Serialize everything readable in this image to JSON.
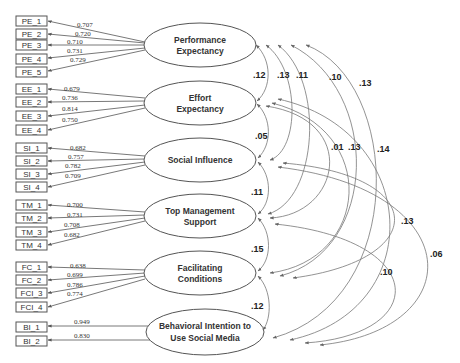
{
  "diagram": {
    "type": "structural-equation-model",
    "constructs": [
      {
        "id": "PE",
        "label_lines": [
          "Performance",
          "Expectancy"
        ],
        "indicators": [
          {
            "name": "PE_1",
            "loading": "0.707"
          },
          {
            "name": "PE_2",
            "loading": "0.720"
          },
          {
            "name": "PE_3",
            "loading": "0.710"
          },
          {
            "name": "PE_4",
            "loading": "0.731"
          },
          {
            "name": "PE_5",
            "loading": "0.729"
          }
        ]
      },
      {
        "id": "EE",
        "label_lines": [
          "Effort",
          "Expectancy"
        ],
        "indicators": [
          {
            "name": "EE_1",
            "loading": "0.679"
          },
          {
            "name": "EE_2",
            "loading": "0.736"
          },
          {
            "name": "EE_3",
            "loading": "0.814"
          },
          {
            "name": "EE_4",
            "loading": "0.750"
          }
        ]
      },
      {
        "id": "SI",
        "label_lines": [
          "Social Influence"
        ],
        "indicators": [
          {
            "name": "SI_1",
            "loading": "0.682"
          },
          {
            "name": "SI_2",
            "loading": "0.757"
          },
          {
            "name": "SI_3",
            "loading": "0.782"
          },
          {
            "name": "SI_4",
            "loading": "0.709"
          }
        ]
      },
      {
        "id": "TM",
        "label_lines": [
          "Top Management",
          "Support"
        ],
        "indicators": [
          {
            "name": "TM_1",
            "loading": "0.700"
          },
          {
            "name": "TM_2",
            "loading": "0.731"
          },
          {
            "name": "TM_3",
            "loading": "0.708"
          },
          {
            "name": "TM_4",
            "loading": "0.682"
          }
        ]
      },
      {
        "id": "FC",
        "label_lines": [
          "Facilitating",
          "Conditions"
        ],
        "indicators": [
          {
            "name": "FC_1",
            "loading": "0.638"
          },
          {
            "name": "FC_2",
            "loading": "0.699"
          },
          {
            "name": "FCI_3",
            "loading": "0.786"
          },
          {
            "name": "FCI_4",
            "loading": "0.774"
          }
        ]
      },
      {
        "id": "BI",
        "label_lines": [
          "Behavioral Intention to",
          "Use Social Media"
        ],
        "indicators": [
          {
            "name": "BI_1",
            "loading": "0.949"
          },
          {
            "name": "BI_2",
            "loading": "0.830"
          }
        ]
      }
    ],
    "covariances": [
      {
        "from": "PE",
        "to": "EE",
        "value": ".12"
      },
      {
        "from": "PE",
        "to": "SI",
        "value": ".13"
      },
      {
        "from": "PE",
        "to": "TM",
        "value": ".11"
      },
      {
        "from": "PE",
        "to": "FC",
        "value": ".10"
      },
      {
        "from": "PE",
        "to": "BI",
        "value": ".13"
      },
      {
        "from": "EE",
        "to": "SI",
        "value": ".05"
      },
      {
        "from": "EE",
        "to": "TM",
        "value": ".01"
      },
      {
        "from": "EE",
        "to": "FC",
        "value": ".13"
      },
      {
        "from": "EE",
        "to": "BI",
        "value": ".14"
      },
      {
        "from": "SI",
        "to": "TM",
        "value": ".11"
      },
      {
        "from": "SI",
        "to": "FC",
        "value": ".13"
      },
      {
        "from": "SI",
        "to": "BI",
        "value": ".06"
      },
      {
        "from": "TM",
        "to": "FC",
        "value": ".15"
      },
      {
        "from": "TM",
        "to": "BI",
        "value": ".10"
      },
      {
        "from": "FC",
        "to": "BI",
        "value": ".12"
      }
    ]
  }
}
